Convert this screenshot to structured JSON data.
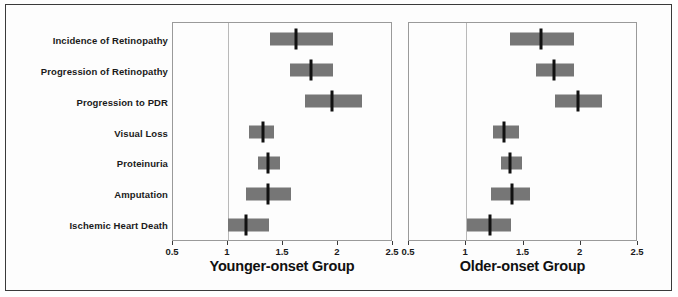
{
  "figure": {
    "outcome_labels": [
      "Incidence of Retinopathy",
      "Progression of Retinopathy",
      "Progression to PDR",
      "Visual Loss",
      "Proteinuria",
      "Amputation",
      "Ischemic Heart Death"
    ],
    "colors": {
      "ci_bar": "#767676",
      "point_estimate": "#111111",
      "null_line": "#b9b9b9",
      "panel_border": "#9a9a9a",
      "outer_frame": "#3a3a3a",
      "background": "#fdfdfd",
      "text": "#1a1a1a"
    }
  },
  "chart_data": [
    {
      "type": "bar",
      "subtype": "forest-plot",
      "title": "Younger-onset Group",
      "xlabel": "Younger-onset Group",
      "ylabel": "",
      "xlim": [
        0.5,
        2.5
      ],
      "xticks": [
        0.5,
        1,
        1.5,
        2,
        2.5
      ],
      "xticklabels": [
        "0.5",
        "1",
        "1.5",
        "2",
        "2.5"
      ],
      "grid": false,
      "reference_line": 1,
      "legend": "none",
      "categories": [
        "Incidence of Retinopathy",
        "Progression of Retinopathy",
        "Progression to PDR",
        "Visual Loss",
        "Proteinuria",
        "Amputation",
        "Ischemic Heart Death"
      ],
      "values": [
        1.63,
        1.77,
        1.96,
        1.33,
        1.37,
        1.37,
        1.17
      ],
      "ci_low": [
        1.39,
        1.57,
        1.71,
        1.2,
        1.28,
        1.17,
        1.0
      ],
      "ci_high": [
        1.97,
        1.97,
        2.23,
        1.43,
        1.48,
        1.58,
        1.38
      ]
    },
    {
      "type": "bar",
      "subtype": "forest-plot",
      "title": "Older-onset Group",
      "xlabel": "Older-onset Group",
      "ylabel": "",
      "xlim": [
        0.5,
        2.5
      ],
      "xticks": [
        0.5,
        1,
        1.5,
        2,
        2.5
      ],
      "xticklabels": [
        "0.5",
        "1",
        "1.5",
        "2",
        "2.5"
      ],
      "grid": false,
      "reference_line": 1,
      "legend": "none",
      "categories": [
        "Incidence of Retinopathy",
        "Progression of Retinopathy",
        "Progression to PDR",
        "Visual Loss",
        "Proteinuria",
        "Amputation",
        "Ischemic Heart Death"
      ],
      "values": [
        1.66,
        1.78,
        1.99,
        1.34,
        1.39,
        1.41,
        1.21
      ],
      "ci_low": [
        1.39,
        1.62,
        1.79,
        1.24,
        1.31,
        1.22,
        1.01
      ],
      "ci_high": [
        1.95,
        1.95,
        2.2,
        1.47,
        1.5,
        1.57,
        1.4
      ]
    }
  ]
}
